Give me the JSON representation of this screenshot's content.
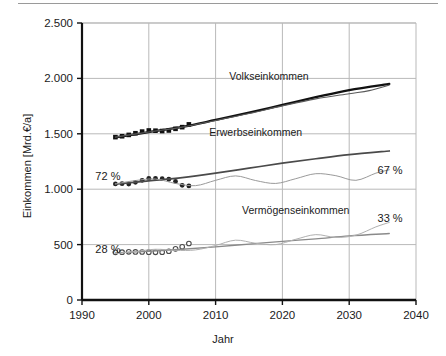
{
  "chart_data": {
    "type": "line",
    "title": "",
    "xlabel": "Jahr",
    "ylabel": "Einkommen [Mrd.€/a]",
    "xlim": [
      1990,
      2040
    ],
    "ylim": [
      0,
      2500
    ],
    "xticks": [
      1990,
      2000,
      2010,
      2020,
      2030,
      2040
    ],
    "xticklabels": [
      "1990",
      "2000",
      "2010",
      "2020",
      "2030",
      "2040"
    ],
    "yticks": [
      0,
      500,
      1000,
      1500,
      2000,
      2500
    ],
    "yticklabels": [
      "0",
      "500",
      "1.000",
      "1.500",
      "2.000",
      "2.500"
    ],
    "grid": "both",
    "legend": "inline-annotations",
    "annotations": [
      {
        "text": "Volkseinkommen",
        "x": 2018,
        "y": 1990
      },
      {
        "text": "Erwerbseinkommen",
        "x": 2016,
        "y": 1480
      },
      {
        "text": "Vermögenseinkommen",
        "x": 2022,
        "y": 780
      },
      {
        "text": "72 %",
        "x": 1992,
        "y": 1080
      },
      {
        "text": "28 %",
        "x": 1992,
        "y": 420
      },
      {
        "text": "67 %",
        "x": 2038,
        "y": 1140
      },
      {
        "text": "33 %",
        "x": 2038,
        "y": 700
      }
    ],
    "series": [
      {
        "name": "Volkseinkommen",
        "kind": "marker",
        "marker": "filled-square",
        "color": "#111111",
        "x": [
          1995,
          1996,
          1997,
          1998,
          1999,
          2000,
          2001,
          2002,
          2003,
          2004,
          2005,
          2006
        ],
        "values": [
          1470,
          1478,
          1490,
          1505,
          1520,
          1530,
          1528,
          1525,
          1530,
          1545,
          1560,
          1585
        ]
      },
      {
        "name": "Volkseinkommen-trend",
        "kind": "line",
        "color": "#111111",
        "x": [
          1995,
          2000,
          2005,
          2010,
          2015,
          2020,
          2025,
          2030,
          2036
        ],
        "values": [
          1468,
          1515,
          1562,
          1625,
          1690,
          1760,
          1830,
          1895,
          1950
        ]
      },
      {
        "name": "Volkseinkommen-scenario",
        "kind": "line",
        "color": "#5a5a5a",
        "x": [
          1995,
          2000,
          2005,
          2010,
          2015,
          2020,
          2025,
          2030,
          2033,
          2036
        ],
        "values": [
          1470,
          1516,
          1560,
          1620,
          1683,
          1752,
          1815,
          1862,
          1890,
          1940
        ]
      },
      {
        "name": "Erwerbseinkommen",
        "kind": "marker",
        "marker": "filled-circle",
        "color": "#222222",
        "x": [
          1995,
          1996,
          1997,
          1998,
          1999,
          2000,
          2001,
          2002,
          2003,
          2004,
          2005,
          2006
        ],
        "values": [
          1048,
          1050,
          1046,
          1062,
          1080,
          1098,
          1098,
          1095,
          1090,
          1070,
          1035,
          1030
        ]
      },
      {
        "name": "Erwerbseinkommen-trend",
        "kind": "line",
        "color": "#4a4a4a",
        "x": [
          1995,
          2000,
          2005,
          2010,
          2015,
          2020,
          2025,
          2030,
          2036
        ],
        "values": [
          1045,
          1075,
          1105,
          1145,
          1190,
          1235,
          1275,
          1312,
          1345
        ]
      },
      {
        "name": "Erwerbseinkommen-scenario",
        "kind": "line",
        "color": "#9a9a9a",
        "x": [
          1995,
          1998,
          2001,
          2004,
          2007,
          2010,
          2013,
          2016,
          2019,
          2022,
          2025,
          2028,
          2031,
          2034,
          2036
        ],
        "values": [
          1048,
          1078,
          1092,
          1052,
          1032,
          1080,
          1120,
          1078,
          1052,
          1095,
          1140,
          1122,
          1080,
          1145,
          1175
        ]
      },
      {
        "name": "Vermögenseinkommen",
        "kind": "marker",
        "marker": "open-circle",
        "color": "#4a4a4a",
        "x": [
          1995,
          1996,
          1997,
          1998,
          1999,
          2000,
          2001,
          2002,
          2003,
          2004,
          2005,
          2006
        ],
        "values": [
          430,
          432,
          435,
          434,
          433,
          432,
          430,
          432,
          440,
          462,
          480,
          510
        ]
      },
      {
        "name": "Vermögenseinkommen-trend",
        "kind": "line",
        "color": "#8a8a8a",
        "x": [
          1995,
          2000,
          2005,
          2010,
          2015,
          2020,
          2025,
          2030,
          2036
        ],
        "values": [
          425,
          440,
          458,
          480,
          505,
          530,
          552,
          578,
          600
        ]
      },
      {
        "name": "Vermögenseinkommen-scenario",
        "kind": "line",
        "color": "#b0b0b0",
        "x": [
          1995,
          1998,
          2001,
          2004,
          2007,
          2010,
          2013,
          2016,
          2019,
          2022,
          2025,
          2028,
          2031,
          2034,
          2036
        ],
        "values": [
          420,
          438,
          458,
          448,
          452,
          492,
          540,
          512,
          500,
          548,
          590,
          565,
          585,
          660,
          700
        ]
      }
    ]
  }
}
